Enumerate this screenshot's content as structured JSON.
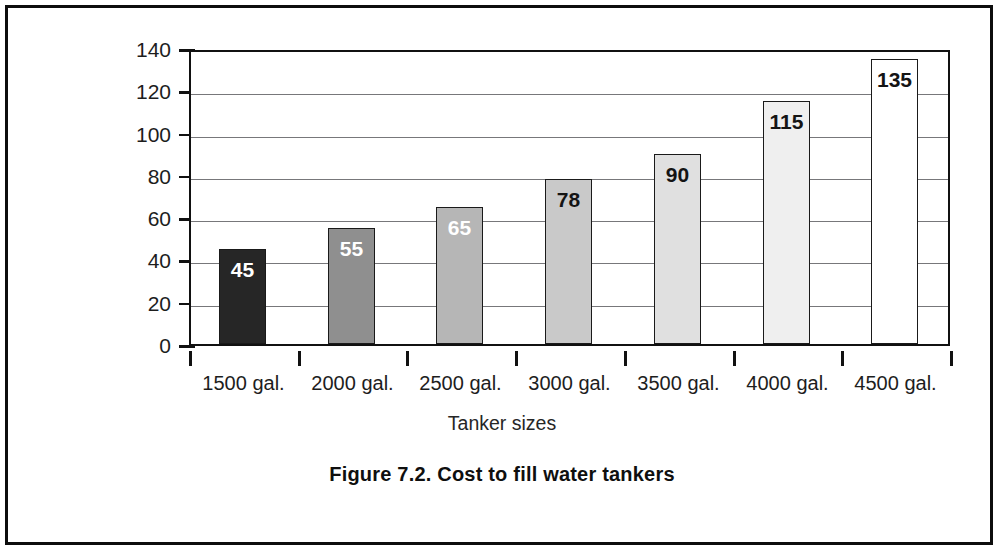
{
  "figure": {
    "caption": "Figure 7.2. Cost to fill water tankers"
  },
  "chart_data": {
    "type": "bar",
    "title": "",
    "xlabel": "Tanker sizes",
    "ylabel": "Amount charged in credits ('000)",
    "categories": [
      "1500 gal.",
      "2000 gal.",
      "2500 gal.",
      "3000 gal.",
      "3500 gal.",
      "4000 gal.",
      "4500 gal."
    ],
    "values": [
      45,
      55,
      65,
      78,
      90,
      115,
      135
    ],
    "value_labels": [
      "45",
      "55",
      "65",
      "78",
      "90",
      "115",
      "135"
    ],
    "bar_colors": [
      "#262626",
      "#8f8f8f",
      "#b6b6b6",
      "#c9c9c9",
      "#e0e0e0",
      "#efefef",
      "#ffffff"
    ],
    "label_colors": [
      "#ffffff",
      "#ffffff",
      "#ffffff",
      "#141414",
      "#141414",
      "#141414",
      "#141414"
    ],
    "ylim": [
      0,
      140
    ],
    "yticks": [
      0,
      20,
      40,
      60,
      80,
      100,
      120,
      140
    ],
    "ytick_labels": [
      "0",
      "20",
      "40",
      "60",
      "80",
      "100",
      "120",
      "140"
    ],
    "grid": true,
    "legend": "none"
  }
}
